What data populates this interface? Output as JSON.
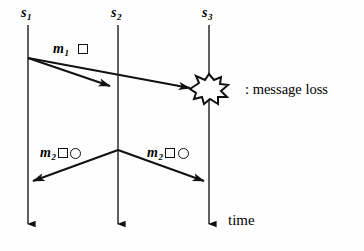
{
  "diagram": {
    "type": "message-sequence-chart",
    "title_text": "",
    "background_color": "#fefefe",
    "stroke_color": "#111111",
    "timelines": [
      {
        "id": "s1",
        "label": "s",
        "subscript": "1",
        "x": 28,
        "y_top": 25,
        "y_bottom": 234
      },
      {
        "id": "s2",
        "label": "s",
        "subscript": "2",
        "x": 118,
        "y_top": 25,
        "y_bottom": 234
      },
      {
        "id": "s3",
        "label": "s",
        "subscript": "3",
        "x": 209,
        "y_top": 25,
        "y_bottom": 234
      }
    ],
    "messages": [
      {
        "id": "m1-to-s2",
        "label": "m",
        "subscript": "1",
        "tags": [
          "square"
        ],
        "from": "s1",
        "to": "s2",
        "delivered": true
      },
      {
        "id": "m1-to-s3",
        "label": "",
        "subscript": "",
        "tags": [],
        "from": "s1",
        "to": "s3",
        "delivered": false
      },
      {
        "id": "m2-to-s1",
        "label": "m",
        "subscript": "2",
        "tags": [
          "square",
          "circle"
        ],
        "from": "s2",
        "to": "s1",
        "delivered": true
      },
      {
        "id": "m2-to-s3",
        "label": "m",
        "subscript": "2",
        "tags": [
          "square",
          "circle"
        ],
        "from": "s2",
        "to": "s3",
        "delivered": true
      }
    ],
    "legend": {
      "symbol": "starburst",
      "text": ": message loss"
    },
    "axis": {
      "label": "time",
      "direction": "downward"
    }
  }
}
